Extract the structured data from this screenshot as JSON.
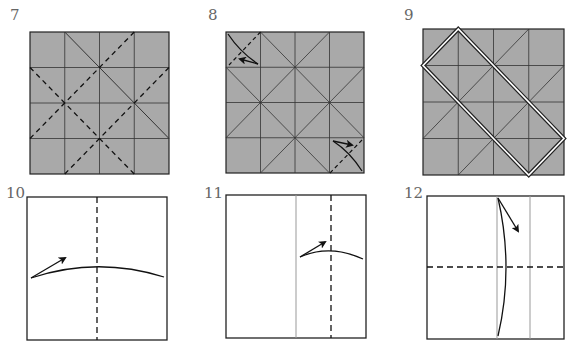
{
  "diagram": {
    "type": "origami-instructions",
    "colors": {
      "paper_colored": "#a9a9a9",
      "paper_white": "#ffffff",
      "line": "#222222",
      "crease_light": "#999999",
      "label": "#666666"
    },
    "steps": [
      {
        "number": "7",
        "paper": "colored",
        "box": [
          30,
          32,
          169,
          174
        ]
      },
      {
        "number": "8",
        "paper": "colored",
        "box": [
          226,
          32,
          364,
          173
        ]
      },
      {
        "number": "9",
        "paper": "colored",
        "box": [
          423,
          29,
          564,
          175
        ]
      },
      {
        "number": "10",
        "paper": "white",
        "box": [
          27,
          197,
          167,
          340
        ]
      },
      {
        "number": "11",
        "paper": "white",
        "box": [
          226,
          195,
          366,
          338
        ]
      },
      {
        "number": "12",
        "paper": "white",
        "box": [
          427,
          196,
          564,
          339
        ]
      }
    ]
  }
}
